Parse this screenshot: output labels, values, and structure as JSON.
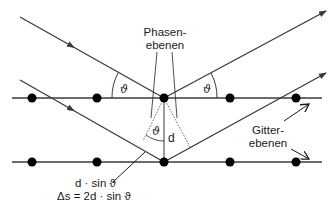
{
  "diagram": {
    "labels": {
      "phase_planes_line1": "Phasen-",
      "phase_planes_line2": "ebenen",
      "lattice_planes_line1": "Gitter-",
      "lattice_planes_line2": "ebenen",
      "angle_left": "ϑ",
      "angle_right": "ϑ",
      "angle_inner": "ϑ",
      "spacing": "d",
      "path_half": "d · sin ϑ",
      "path_difference": "Δs = 2d · sin ϑ"
    },
    "lattice_planes": [
      {
        "y": 98,
        "atoms_x": [
          32,
          97,
          164,
          230,
          296
        ]
      },
      {
        "y": 162,
        "atoms_x": [
          32,
          97,
          164,
          230,
          296
        ]
      }
    ],
    "rays": [
      {
        "type": "incident",
        "from": [
          20,
          17
        ],
        "to": [
          164,
          98
        ]
      },
      {
        "type": "reflected",
        "from": [
          164,
          98
        ],
        "to": [
          326,
          11
        ]
      },
      {
        "type": "incident",
        "from": [
          20,
          80
        ],
        "to": [
          164,
          162
        ]
      },
      {
        "type": "reflected",
        "from": [
          164,
          162
        ],
        "to": [
          326,
          73
        ]
      }
    ],
    "colors": {
      "line": "#3a3a3a",
      "atom": "#000000",
      "text": "#1a1a1a"
    }
  }
}
